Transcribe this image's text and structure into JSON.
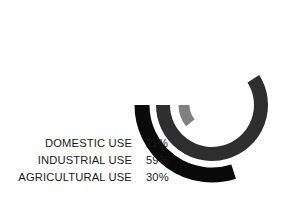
{
  "chart_data": {
    "type": "pie",
    "variant": "radial-bar",
    "title": "",
    "subtitle": "",
    "xlabel": "",
    "ylabel": "",
    "legend_position": "left",
    "grid": false,
    "units": "percent",
    "total": 100,
    "center": {
      "x": 212,
      "y": 105
    },
    "start_angle_deg": 180,
    "direction": "counterclockwise",
    "categories": [
      "DOMESTIC USE",
      "INDUSTRIAL USE",
      "AGRICULTURAL USE"
    ],
    "values": [
      11,
      30,
      59
    ],
    "value_labels": [
      "11%",
      "59%",
      "30%"
    ],
    "series": [
      {
        "name": "DOMESTIC USE",
        "value": 11,
        "label": "11%",
        "color": "#808080",
        "ring": "inner",
        "radius": 28,
        "thickness": 11,
        "sweep_deg": 39.6
      },
      {
        "name": "INDUSTRIAL USE",
        "value": 59,
        "label": "59%",
        "color": "#2e2e2e",
        "ring": "middle",
        "radius": 49,
        "thickness": 14,
        "sweep_deg": 212.4
      },
      {
        "name": "AGRICULTURAL USE",
        "value": 30,
        "label": "30%",
        "color": "#0a0a0a",
        "ring": "outer",
        "radius": 70,
        "thickness": 15,
        "sweep_deg": 108.0
      }
    ]
  },
  "legend": {
    "rows": [
      {
        "label": "DOMESTIC USE",
        "value": "11%",
        "color": "#808080"
      },
      {
        "label": "INDUSTRIAL USE",
        "value": "59%",
        "color": "#2e2e2e"
      },
      {
        "label": "AGRICULTURAL USE",
        "value": "30%",
        "color": "#0a0a0a"
      }
    ]
  },
  "colors": {
    "background": "#ffffff",
    "text": "#1c1c1c",
    "domestic": "#808080",
    "industrial": "#2e2e2e",
    "agricultural": "#0a0a0a"
  }
}
